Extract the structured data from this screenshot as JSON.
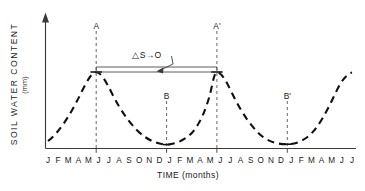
{
  "chart_data": {
    "type": "line",
    "title": "",
    "xlabel": "TIME (months)",
    "ylabel": "SOIL WATER CONTENT",
    "ylabel_unit": "(mm)",
    "grid": false,
    "legend": "none",
    "line_style": "dashed",
    "line_color": "#111111",
    "axis_color": "#3a3a3a",
    "xlim": [
      0,
      30
    ],
    "ylim": [
      0,
      1
    ],
    "y_ticks_shown": false,
    "x_tick_labels": [
      "J",
      "F",
      "M",
      "A",
      "M",
      "J",
      "J",
      "A",
      "S",
      "O",
      "N",
      "D",
      "J",
      "F",
      "M",
      "A",
      "M",
      "J",
      "J",
      "A",
      "S",
      "O",
      "N",
      "D",
      "J",
      "F",
      "M",
      "A",
      "M",
      "J",
      "J"
    ],
    "x_tick_marks_at": [
      5,
      12,
      17,
      24
    ],
    "x": [
      0,
      1,
      2,
      3,
      4,
      5,
      6,
      7,
      8,
      9,
      10,
      11,
      12,
      13,
      14,
      15,
      16,
      17,
      18,
      19,
      20,
      21,
      22,
      23,
      24,
      25,
      26,
      27,
      28,
      29,
      30
    ],
    "values": [
      0.115,
      0.27,
      0.44,
      0.6,
      0.695,
      0.72,
      0.695,
      0.6,
      0.45,
      0.315,
      0.215,
      0.155,
      0.135,
      0.155,
      0.235,
      0.4,
      0.575,
      0.705,
      0.72,
      0.675,
      0.565,
      0.425,
      0.295,
      0.195,
      0.145,
      0.155,
      0.235,
      0.4,
      0.565,
      0.665,
      0.705
    ],
    "annotations": {
      "points": [
        {
          "id": "A",
          "label": "A",
          "x": 5,
          "y": 0.72,
          "type": "peak"
        },
        {
          "id": "B",
          "label": "B",
          "x": 12,
          "y": 0.135,
          "type": "trough"
        },
        {
          "id": "A2",
          "label": "A'",
          "x": 17,
          "y": 0.72,
          "type": "peak"
        },
        {
          "id": "B2",
          "label": "B'",
          "x": 24,
          "y": 0.145,
          "type": "trough"
        }
      ],
      "delta_s": {
        "label": "△S→O",
        "from_point": "A",
        "to_point": "A'",
        "style": "double-horizontal-line-with-leader"
      }
    }
  },
  "axis": {
    "y_title": "SOIL WATER CONTENT",
    "y_unit": "(mm)",
    "x_title": "TIME (months)"
  },
  "labels": {
    "point_a": "A",
    "point_b": "B",
    "point_a_prime": "A'",
    "point_b_prime": "B'",
    "delta_s": "△S→O"
  }
}
